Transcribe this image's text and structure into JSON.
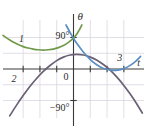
{
  "figure": {
    "background": "#ffffff",
    "grid_color": "#d9d6e0",
    "axis_color": "#3a3a3a",
    "text_color": "#2b2b2b"
  },
  "axes": {
    "x_axis_label": "t",
    "y_axis_label": "θ",
    "origin_label": "0",
    "y_tick_top_label": "90°",
    "y_tick_bottom_label": "−90°",
    "x_range": [
      -4.2,
      4.2
    ],
    "y_range": [
      -140,
      140
    ],
    "grid": true,
    "grid_x_lines": [
      -3,
      -2,
      -1,
      0,
      1,
      2,
      3
    ],
    "grid_y_lines": [
      -90,
      -45,
      45,
      90
    ],
    "x_ticks": [
      -3,
      -2,
      -1,
      1,
      2,
      3
    ],
    "y_ticks": [
      -90,
      90
    ]
  },
  "curves": {
    "labels": {
      "curve1": "1",
      "curve2": "2",
      "curve3": "3"
    },
    "colors": {
      "curve1": "#6f9a49",
      "curve2": "#6b6076",
      "curve3": "#5b8fc4"
    }
  },
  "chart_data": {
    "type": "line",
    "title": "",
    "xlabel": "t",
    "ylabel": "θ",
    "xlim": [
      -4.2,
      4.2
    ],
    "ylim": [
      -140,
      140
    ],
    "grid": true,
    "xticks": [
      -3,
      -2,
      -1,
      0,
      1,
      2,
      3
    ],
    "xticklabels": [
      "",
      "",
      "",
      "0",
      "",
      "",
      ""
    ],
    "yticks": [
      -90,
      90
    ],
    "yticklabels": [
      "−90°",
      "90°"
    ],
    "legend": "inline-labels",
    "annotations": [
      {
        "text": "1",
        "x": -3.1,
        "y": 78,
        "color": "#2b2b2b"
      },
      {
        "text": "2",
        "x": -3.55,
        "y": -36,
        "color": "#2b2b2b"
      },
      {
        "text": "3",
        "x": 2.75,
        "y": 22,
        "color": "#2b2b2b"
      }
    ],
    "series": [
      {
        "name": "1",
        "color": "#6f9a49",
        "x": [
          -4.2,
          -3.9,
          -3.6,
          -3.3,
          -3.0,
          -2.7,
          -2.4,
          -2.1,
          -1.8,
          -1.5,
          -1.2,
          -0.9,
          -0.6,
          -0.3,
          0.0,
          0.2,
          0.35,
          0.5
        ],
        "y": [
          96,
          86,
          77,
          70,
          64,
          60,
          57,
          55,
          54,
          55,
          57,
          61,
          67,
          76,
          88,
          100,
          112,
          126
        ]
      },
      {
        "name": "2",
        "color": "#6b6076",
        "x": [
          -3.8,
          -3.4,
          -3.0,
          -2.6,
          -2.2,
          -1.8,
          -1.4,
          -1.0,
          -0.6,
          -0.2,
          0.2,
          0.6,
          1.0,
          1.4,
          1.8,
          2.2,
          2.6,
          3.0,
          3.4,
          3.8,
          4.1
        ],
        "y": [
          -134,
          -104,
          -76,
          -50,
          -27,
          -7,
          10,
          24,
          34,
          40,
          42,
          40,
          34,
          25,
          12,
          -4,
          -24,
          -47,
          -73,
          -102,
          -126
        ]
      },
      {
        "name": "3",
        "color": "#5b8fc4",
        "x": [
          -0.45,
          -0.2,
          0.1,
          0.4,
          0.7,
          1.0,
          1.3,
          1.6,
          1.9,
          2.2,
          2.5,
          2.8,
          3.1,
          3.4,
          3.7,
          4.0
        ],
        "y": [
          126,
          104,
          80,
          60,
          42,
          27,
          15,
          6,
          0,
          -3,
          -4,
          -2,
          3,
          11,
          22,
          36
        ]
      }
    ]
  }
}
